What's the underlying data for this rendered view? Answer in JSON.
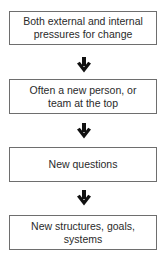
{
  "diagram": {
    "type": "flowchart",
    "direction": "top-to-bottom",
    "border_color": "#6e6e6e",
    "arrow_color": "#111111",
    "text_color": "#2a2a2a",
    "steps": [
      {
        "label": "Both external and internal pressures for change"
      },
      {
        "label": "Often a new person, or team at the top"
      },
      {
        "label": "New questions"
      },
      {
        "label": "New structures, goals, systems"
      }
    ],
    "connectors": [
      {
        "from": 0,
        "to": 1,
        "icon": "down-arrow-icon"
      },
      {
        "from": 1,
        "to": 2,
        "icon": "down-arrow-icon"
      },
      {
        "from": 2,
        "to": 3,
        "icon": "down-arrow-icon"
      }
    ]
  }
}
